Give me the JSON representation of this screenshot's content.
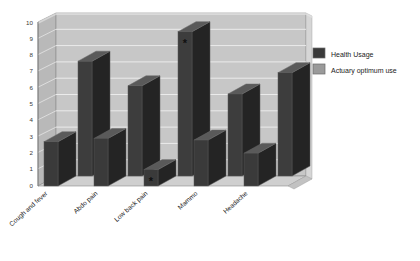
{
  "chart_data": {
    "type": "bar",
    "title": "",
    "subtitle": "",
    "xlabel": "",
    "ylabel": "",
    "ylim": [
      0,
      10
    ],
    "yticks": [
      "0",
      "1",
      "2",
      "3",
      "4",
      "5",
      "6",
      "7",
      "8",
      "9",
      "10"
    ],
    "grid": true,
    "three_d": true,
    "legend_position": "right",
    "categories": [
      "Cough and fever",
      "Abdo pain",
      "Low back pain",
      "Mammo",
      "Headache"
    ],
    "series": [
      {
        "name": "Health Usage",
        "color": "#3a3a3a",
        "values": [
          2.7,
          2.9,
          1.0,
          2.8,
          2.0
        ]
      },
      {
        "name": "Actuary optimum use",
        "color": "#8f8f8f",
        "values": [
          7.0,
          5.5,
          8.8,
          5.0,
          6.3
        ]
      }
    ],
    "annotations": [
      {
        "text": "*",
        "series": "Health Usage",
        "category": "Low back pain"
      },
      {
        "text": "*",
        "series": "Actuary optimum use",
        "category": "Low back pain"
      }
    ]
  },
  "legend": {
    "items": [
      {
        "label": "Health Usage",
        "swatch": "#3a3a3a"
      },
      {
        "label": "Actuary optimum use",
        "swatch": "#8f8f8f"
      }
    ]
  },
  "axis": {
    "y_ticks": [
      "10",
      "9",
      "8",
      "7",
      "6",
      "5",
      "4",
      "3",
      "2",
      "1",
      "0"
    ]
  },
  "colors": {
    "wall_back": "#c9c9c9",
    "wall_side": "#bdbdbd",
    "floor": "#cccccc",
    "gridline": "#eeeeee",
    "bar_front_dark": "#3a3a3a",
    "bar_side_dark": "#2a2a2a",
    "bar_top_dark": "#4f4f4f",
    "outline": "#555555"
  }
}
